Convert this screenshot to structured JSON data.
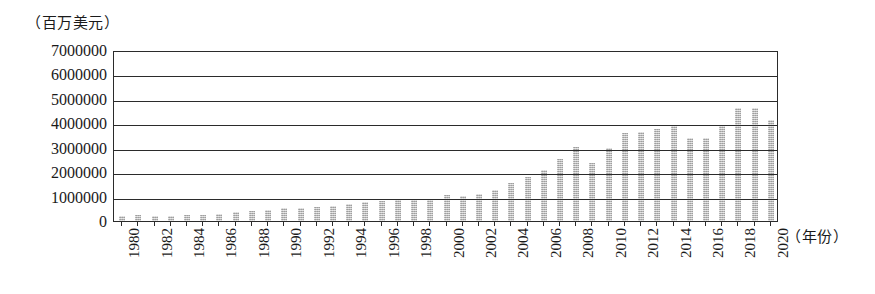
{
  "chart_data": {
    "type": "bar",
    "title": "",
    "subtitle": "",
    "ylabel": "（百万美元）",
    "xlabel": "（年份）",
    "ylim": [
      0,
      7000000
    ],
    "ytick_values": [
      0,
      1000000,
      2000000,
      3000000,
      4000000,
      5000000,
      6000000,
      7000000
    ],
    "ytick_labels": [
      "0",
      "1000000",
      "2000000",
      "3000000",
      "4000000",
      "5000000",
      "6000000",
      "7000000"
    ],
    "grid": "horizontal",
    "legend": "none",
    "xtick_labels": [
      "1980",
      "1982",
      "1984",
      "1986",
      "1988",
      "1990",
      "1992",
      "1994",
      "1996",
      "1998",
      "2000",
      "2002",
      "2004",
      "2006",
      "2008",
      "2010",
      "2012",
      "2014",
      "2016",
      "2018",
      "2020"
    ],
    "xtick_step": 2,
    "bar_color": "#b9b9b9",
    "axis_color": "#2b2b2b",
    "categories": [
      "1980",
      "1981",
      "1982",
      "1983",
      "1984",
      "1985",
      "1986",
      "1987",
      "1988",
      "1989",
      "1990",
      "1991",
      "1992",
      "1993",
      "1994",
      "1995",
      "1996",
      "1997",
      "1998",
      "1999",
      "2000",
      "2001",
      "2002",
      "2003",
      "2004",
      "2005",
      "2006",
      "2007",
      "2008",
      "2009",
      "2010",
      "2011",
      "2012",
      "2013",
      "2014",
      "2015",
      "2016",
      "2017",
      "2018",
      "2019",
      "2020"
    ],
    "values": [
      210000,
      230000,
      220000,
      220000,
      250000,
      260000,
      300000,
      350000,
      400000,
      450000,
      520000,
      540000,
      580000,
      600000,
      680000,
      780000,
      820000,
      880000,
      880000,
      920000,
      1050000,
      1020000,
      1090000,
      1280000,
      1560000,
      1790000,
      2070000,
      2520000,
      3020000,
      2380000,
      3000000,
      3600000,
      3630000,
      3760000,
      3950000,
      3400000,
      3400000,
      3880000,
      4620000,
      4620000,
      4120000
    ]
  }
}
